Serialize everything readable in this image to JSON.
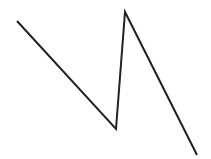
{
  "drawing": {
    "description": "Hand-drawn zigzag polyline (N-shaped stroke)",
    "stroke_color": "#222222",
    "stroke_width": 2,
    "background": "#ffffff",
    "points": [
      {
        "x": 17,
        "y": 21
      },
      {
        "x": 116,
        "y": 129
      },
      {
        "x": 125,
        "y": 12
      },
      {
        "x": 197,
        "y": 155
      }
    ]
  }
}
